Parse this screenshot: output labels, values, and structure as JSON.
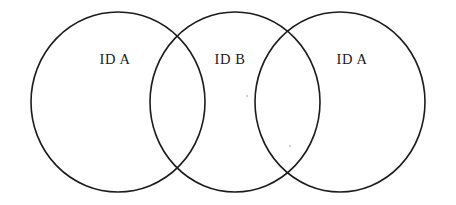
{
  "diagram": {
    "type": "venn-chain",
    "background_color": "#ffffff",
    "stroke_color": "#1c1c1c",
    "label_color": "#1a1a1a",
    "canvas": {
      "width": 456,
      "height": 205
    },
    "circles": [
      {
        "id": "circle-left",
        "label": "ID A",
        "cx": 118,
        "cy": 102,
        "rx": 87,
        "ry": 90,
        "label_x": 115,
        "label_y": 64
      },
      {
        "id": "circle-middle",
        "label": "ID B",
        "cx": 235,
        "cy": 102,
        "rx": 85,
        "ry": 90,
        "label_x": 230,
        "label_y": 64
      },
      {
        "id": "circle-right",
        "label": "ID A",
        "cx": 340,
        "cy": 102,
        "rx": 85,
        "ry": 90,
        "label_x": 352,
        "label_y": 64
      }
    ],
    "intersections": [
      {
        "id": "overlap-left-middle",
        "top_x": 178,
        "top_y": 32,
        "bottom_x": 178,
        "bottom_y": 172
      },
      {
        "id": "overlap-middle-right",
        "top_x": 288,
        "top_y": 33,
        "bottom_x": 288,
        "bottom_y": 171
      }
    ],
    "specks": [
      {
        "x": 247,
        "y": 96
      },
      {
        "x": 290,
        "y": 146
      }
    ]
  }
}
